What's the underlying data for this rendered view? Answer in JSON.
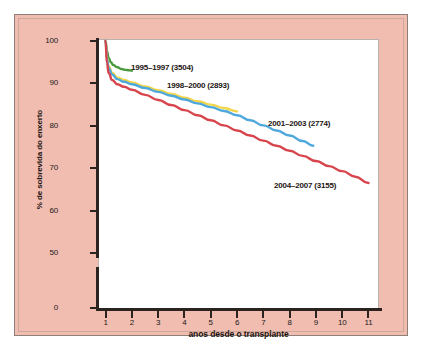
{
  "figure": {
    "background_color": "#f0bdb0",
    "plot_background_color": "#ffffff",
    "border_color": "#8c8078"
  },
  "chart_data": {
    "type": "line",
    "title": "",
    "xlabel": "anos desde o transplante",
    "ylabel": "% de sobrevida do enxerto",
    "xlim": [
      0.75,
      11.4
    ],
    "ylim": [
      0,
      101
    ],
    "grid": false,
    "legend_position": "inline-annotations",
    "y_axis_break": true,
    "y_break_between": [
      5,
      45
    ],
    "xticks": [
      1,
      2,
      3,
      4,
      5,
      6,
      7,
      8,
      9,
      10,
      11
    ],
    "xtick_labels": [
      "1",
      "2",
      "3",
      "4",
      "5",
      "6",
      "7",
      "8",
      "9",
      "10",
      "11"
    ],
    "yticks": [
      0,
      50,
      60,
      70,
      80,
      90,
      100
    ],
    "ytick_labels": [
      "0",
      "50",
      "60",
      "70",
      "80",
      "90",
      "100"
    ],
    "series": [
      {
        "name": "1995–1997 (3504)",
        "label": "1995–1997 (3504)",
        "count": 3504,
        "color": "#4c9a3f",
        "x": [
          1.0,
          1.05,
          1.12,
          1.2,
          1.3,
          1.45,
          1.6,
          1.75,
          1.9,
          2.0
        ],
        "values": [
          100.0,
          97.6,
          96.0,
          95.0,
          94.3,
          93.8,
          93.4,
          93.2,
          93.1,
          93.0
        ]
      },
      {
        "name": "1998–2000 (2893)",
        "label": "1998–2000 (2893)",
        "count": 2893,
        "color": "#f2d64b",
        "x": [
          1.0,
          1.05,
          1.12,
          1.25,
          1.45,
          1.7,
          2.0,
          2.5,
          3.0,
          3.5,
          4.0,
          4.5,
          5.0,
          5.5,
          6.0
        ],
        "values": [
          100.0,
          96.2,
          94.0,
          92.5,
          91.4,
          90.8,
          90.2,
          89.3,
          88.4,
          87.5,
          86.6,
          85.8,
          85.0,
          84.2,
          83.4
        ]
      },
      {
        "name": "2001–2003 (2774)",
        "label": "2001–2003 (2774)",
        "count": 2774,
        "color": "#4fa8dc",
        "x": [
          1.0,
          1.05,
          1.12,
          1.25,
          1.45,
          1.7,
          2.0,
          2.5,
          3.0,
          3.5,
          4.0,
          4.5,
          5.0,
          5.5,
          6.0,
          6.5,
          7.0,
          7.5,
          8.0,
          8.5,
          8.9
        ],
        "values": [
          100.0,
          95.8,
          93.6,
          92.1,
          91.0,
          90.4,
          89.8,
          88.9,
          88.0,
          87.1,
          86.2,
          85.3,
          84.4,
          83.5,
          82.5,
          81.3,
          80.1,
          78.9,
          77.7,
          76.4,
          75.3
        ]
      },
      {
        "name": "2004–2007 (3155)",
        "label": "2004–2007 (3155)",
        "count": 3155,
        "color": "#d8444c",
        "x": [
          1.0,
          1.05,
          1.12,
          1.25,
          1.45,
          1.7,
          2.0,
          2.5,
          3.0,
          3.5,
          4.0,
          4.5,
          5.0,
          5.5,
          6.0,
          6.5,
          7.0,
          7.5,
          8.0,
          8.5,
          9.0,
          9.5,
          10.0,
          10.5,
          11.0
        ],
        "values": [
          100.0,
          94.8,
          92.4,
          90.8,
          89.8,
          89.2,
          88.5,
          87.3,
          86.1,
          84.9,
          83.7,
          82.5,
          81.3,
          80.1,
          78.9,
          77.7,
          76.5,
          75.3,
          74.1,
          72.9,
          71.7,
          70.5,
          69.3,
          68.0,
          66.5
        ]
      }
    ]
  }
}
